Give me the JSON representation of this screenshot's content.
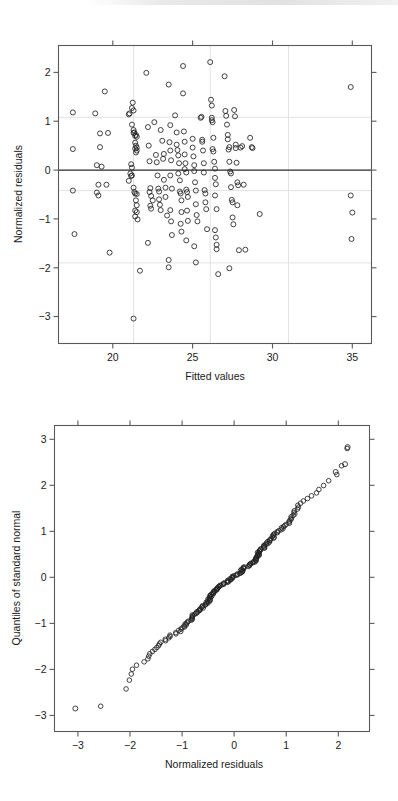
{
  "page": {
    "background": "#ffffff",
    "width": 398,
    "height": 801
  },
  "chart_data": [
    {
      "id": "residuals-vs-fitted",
      "type": "scatter",
      "title": "",
      "xlabel": "Fitted values",
      "ylabel": "Normalized residuals",
      "xlim": [
        16.6,
        36.2
      ],
      "ylim": [
        -3.55,
        2.55
      ],
      "xticks": [
        20,
        25,
        30,
        35
      ],
      "yticks": [
        2,
        1,
        0,
        -1,
        -2,
        -3
      ],
      "xticklabels": [
        "20",
        "25",
        "30",
        "35"
      ],
      "yticklabels": [
        "2",
        "1",
        "0",
        "-1",
        "-2",
        "-3"
      ],
      "grid": true,
      "gridcolor": "#e2e2e2",
      "vgrid_x": [
        21.3,
        26.1,
        31.0
      ],
      "hgrid_y": [
        1.08,
        -0.42,
        -1.9
      ],
      "reference_line_y": 0,
      "marker": "open-circle",
      "marker_color": "#222222",
      "legend": "none",
      "points": [
        [
          17.5,
          1.18
        ],
        [
          17.5,
          0.43
        ],
        [
          17.5,
          -0.42
        ],
        [
          17.6,
          -1.31
        ],
        [
          18.9,
          1.16
        ],
        [
          19.0,
          0.1
        ],
        [
          19.1,
          -0.3
        ],
        [
          19.0,
          -0.46
        ],
        [
          19.1,
          -0.52
        ],
        [
          19.2,
          0.75
        ],
        [
          19.2,
          0.47
        ],
        [
          19.3,
          0.07
        ],
        [
          19.5,
          1.61
        ],
        [
          19.6,
          -0.3
        ],
        [
          19.7,
          0.76
        ],
        [
          19.8,
          -1.69
        ],
        [
          21.0,
          1.14
        ],
        [
          21.05,
          1.16
        ],
        [
          21.1,
          -0.07
        ],
        [
          21.15,
          -0.12
        ],
        [
          21.2,
          -0.11
        ],
        [
          21.15,
          0.12
        ],
        [
          21.2,
          0.05
        ],
        [
          21.0,
          -0.22
        ],
        [
          21.2,
          1.27
        ],
        [
          21.25,
          1.38
        ],
        [
          21.3,
          1.22
        ],
        [
          21.2,
          0.93
        ],
        [
          21.3,
          0.82
        ],
        [
          21.35,
          0.77
        ],
        [
          21.3,
          0.76
        ],
        [
          21.4,
          0.7
        ],
        [
          21.45,
          0.72
        ],
        [
          21.5,
          0.68
        ],
        [
          21.4,
          0.56
        ],
        [
          21.45,
          0.5
        ],
        [
          21.5,
          0.46
        ],
        [
          21.4,
          0.44
        ],
        [
          21.5,
          0.4
        ],
        [
          21.45,
          0.36
        ],
        [
          21.3,
          -0.36
        ],
        [
          21.35,
          -0.45
        ],
        [
          21.4,
          -0.48
        ],
        [
          21.5,
          -0.49
        ],
        [
          21.45,
          -0.62
        ],
        [
          21.5,
          -0.72
        ],
        [
          21.4,
          -0.83
        ],
        [
          21.5,
          -0.86
        ],
        [
          21.4,
          -0.95
        ],
        [
          21.55,
          -1.01
        ],
        [
          21.7,
          -2.06
        ],
        [
          21.3,
          -3.04
        ],
        [
          22.1,
          1.99
        ],
        [
          22.2,
          0.88
        ],
        [
          22.25,
          0.5
        ],
        [
          22.3,
          0.18
        ],
        [
          22.35,
          -0.37
        ],
        [
          22.3,
          -0.45
        ],
        [
          22.4,
          -0.53
        ],
        [
          22.35,
          -0.73
        ],
        [
          22.4,
          -0.79
        ],
        [
          22.5,
          -0.62
        ],
        [
          22.2,
          -1.49
        ],
        [
          22.6,
          0.98
        ],
        [
          22.7,
          0.31
        ],
        [
          22.75,
          0.16
        ],
        [
          22.8,
          -0.11
        ],
        [
          22.85,
          -0.38
        ],
        [
          22.9,
          -0.44
        ],
        [
          22.9,
          -0.6
        ],
        [
          22.95,
          -0.71
        ],
        [
          23.0,
          -0.82
        ],
        [
          23.0,
          0.82
        ],
        [
          23.1,
          0.6
        ],
        [
          23.2,
          0.33
        ],
        [
          23.15,
          0.23
        ],
        [
          23.2,
          -0.2
        ],
        [
          23.3,
          -0.36
        ],
        [
          23.3,
          -0.55
        ],
        [
          23.4,
          -0.93
        ],
        [
          23.5,
          1.75
        ],
        [
          23.6,
          0.92
        ],
        [
          23.55,
          0.57
        ],
        [
          23.6,
          0.4
        ],
        [
          23.65,
          0.2
        ],
        [
          23.6,
          -0.11
        ],
        [
          23.7,
          -0.38
        ],
        [
          23.6,
          -0.82
        ],
        [
          23.65,
          -1.05
        ],
        [
          23.7,
          -1.33
        ],
        [
          23.5,
          -1.84
        ],
        [
          23.5,
          -1.99
        ],
        [
          23.9,
          1.12
        ],
        [
          24.0,
          0.77
        ],
        [
          24.0,
          0.52
        ],
        [
          24.05,
          0.41
        ],
        [
          24.1,
          0.3
        ],
        [
          24.15,
          0.14
        ],
        [
          24.1,
          -0.07
        ],
        [
          24.2,
          -0.21
        ],
        [
          24.2,
          -0.44
        ],
        [
          24.25,
          -0.48
        ],
        [
          24.3,
          -0.62
        ],
        [
          24.3,
          -0.86
        ],
        [
          24.25,
          -1.1
        ],
        [
          24.3,
          -1.26
        ],
        [
          24.4,
          2.13
        ],
        [
          24.4,
          1.57
        ],
        [
          24.45,
          0.79
        ],
        [
          24.5,
          0.58
        ],
        [
          24.5,
          0.32
        ],
        [
          24.55,
          0.14
        ],
        [
          24.5,
          0.02
        ],
        [
          24.6,
          -0.05
        ],
        [
          24.6,
          -0.4
        ],
        [
          24.65,
          -0.45
        ],
        [
          24.7,
          -0.55
        ],
        [
          24.65,
          -0.83
        ],
        [
          24.7,
          -1.04
        ],
        [
          24.6,
          -1.44
        ],
        [
          25.0,
          0.64
        ],
        [
          25.0,
          0.46
        ],
        [
          25.05,
          0.28
        ],
        [
          25.1,
          0.1
        ],
        [
          25.1,
          -0.02
        ],
        [
          25.15,
          -0.25
        ],
        [
          25.2,
          -0.42
        ],
        [
          25.2,
          -0.7
        ],
        [
          25.25,
          -0.92
        ],
        [
          25.3,
          -1.05
        ],
        [
          25.1,
          -1.56
        ],
        [
          25.2,
          -1.89
        ],
        [
          25.5,
          1.07
        ],
        [
          25.55,
          1.09
        ],
        [
          25.6,
          0.62
        ],
        [
          25.6,
          0.58
        ],
        [
          25.65,
          0.4
        ],
        [
          25.7,
          0.14
        ],
        [
          25.7,
          -0.05
        ],
        [
          25.75,
          -0.41
        ],
        [
          25.8,
          -0.48
        ],
        [
          25.8,
          -0.66
        ],
        [
          25.85,
          -0.8
        ],
        [
          25.9,
          -1.21
        ],
        [
          26.1,
          2.21
        ],
        [
          26.15,
          1.44
        ],
        [
          26.2,
          1.32
        ],
        [
          26.2,
          1.07
        ],
        [
          26.25,
          0.98
        ],
        [
          26.3,
          0.66
        ],
        [
          26.25,
          0.43
        ],
        [
          26.3,
          0.38
        ],
        [
          26.35,
          0.17
        ],
        [
          26.4,
          0.03
        ],
        [
          26.4,
          -0.16
        ],
        [
          26.45,
          -0.29
        ],
        [
          26.4,
          -0.52
        ],
        [
          26.5,
          -0.8
        ],
        [
          26.4,
          -1.23
        ],
        [
          26.45,
          -1.38
        ],
        [
          26.5,
          -1.53
        ],
        [
          26.5,
          -1.62
        ],
        [
          26.6,
          -2.13
        ],
        [
          26.2,
          1.02
        ],
        [
          27.0,
          1.92
        ],
        [
          27.05,
          1.21
        ],
        [
          27.1,
          1.11
        ],
        [
          27.15,
          0.93
        ],
        [
          27.2,
          0.72
        ],
        [
          27.2,
          0.63
        ],
        [
          27.25,
          0.42
        ],
        [
          27.3,
          0.47
        ],
        [
          27.3,
          0.17
        ],
        [
          27.35,
          -0.03
        ],
        [
          27.4,
          -0.07
        ],
        [
          27.4,
          -0.35
        ],
        [
          27.45,
          -0.61
        ],
        [
          27.5,
          -0.66
        ],
        [
          27.5,
          -0.97
        ],
        [
          27.55,
          -1.11
        ],
        [
          27.3,
          -2.01
        ],
        [
          27.6,
          1.23
        ],
        [
          27.65,
          1.1
        ],
        [
          27.7,
          0.52
        ],
        [
          27.7,
          0.45
        ],
        [
          27.75,
          0.15
        ],
        [
          27.8,
          -0.25
        ],
        [
          27.85,
          -0.31
        ],
        [
          27.8,
          -0.72
        ],
        [
          27.9,
          -1.64
        ],
        [
          28.0,
          0.46
        ],
        [
          28.1,
          0.49
        ],
        [
          28.2,
          -0.3
        ],
        [
          28.3,
          -1.63
        ],
        [
          28.6,
          0.66
        ],
        [
          28.7,
          0.47
        ],
        [
          28.75,
          0.45
        ],
        [
          29.2,
          -0.9
        ],
        [
          34.9,
          1.7
        ],
        [
          34.9,
          -0.52
        ],
        [
          35.0,
          -0.87
        ],
        [
          34.95,
          -1.41
        ]
      ]
    },
    {
      "id": "normal-qq",
      "type": "scatter",
      "title": "",
      "xlabel": "Normalized residuals",
      "ylabel": "Quantiles of standard normal",
      "xlim": [
        -3.45,
        2.6
      ],
      "ylim": [
        -3.35,
        3.3
      ],
      "xticks": [
        -3,
        -2,
        -1,
        0,
        1,
        2
      ],
      "yticks": [
        3,
        2,
        1,
        0,
        -1,
        -2,
        -3
      ],
      "xticklabels": [
        "-3",
        "-2",
        "-1",
        "0",
        "1",
        "2"
      ],
      "yticklabels": [
        "3",
        "2",
        "1",
        "0",
        "-1",
        "-2",
        "-3"
      ],
      "grid": false,
      "marker": "open-circle",
      "marker_color": "#222222",
      "legend": "none",
      "n_points": 196,
      "description": "Near-linear normal quantile-quantile plot of normalized residuals; one low outlier at (-3.05, -2.85), slight upward curvature in upper tail.",
      "outliers": [
        [
          -3.05,
          -2.85
        ],
        [
          2.18,
          2.83
        ],
        [
          2.13,
          2.46
        ],
        [
          1.95,
          2.29
        ]
      ]
    }
  ]
}
